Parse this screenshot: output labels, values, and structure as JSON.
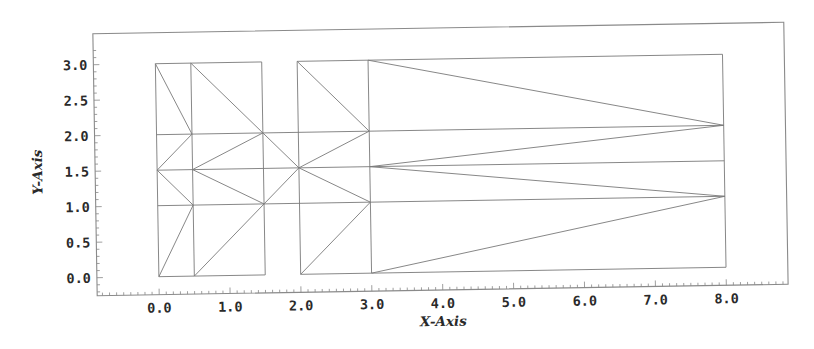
{
  "chart_data": {
    "type": "mesh",
    "title": "",
    "xlabel": "X-Axis",
    "ylabel": "Y-Axis",
    "xlim": [
      -0.9,
      8.9
    ],
    "ylim": [
      -0.45,
      3.3
    ],
    "grid": false,
    "legend": null,
    "x_ticks": [
      "0.0",
      "1.0",
      "2.0",
      "3.0",
      "4.0",
      "5.0",
      "6.0",
      "7.0",
      "8.0"
    ],
    "y_ticks": [
      "0.0",
      "0.5",
      "1.0",
      "1.5",
      "2.0",
      "2.5",
      "3.0"
    ],
    "blocks": [
      {
        "name": "block-1",
        "x": [
          0.0,
          0.5
        ],
        "y": [
          0.0,
          3.0
        ]
      },
      {
        "name": "block-2",
        "x": [
          0.5,
          1.5
        ],
        "y": [
          0.0,
          3.0
        ]
      },
      {
        "name": "block-3",
        "x": [
          2.0,
          3.0
        ],
        "y": [
          0.0,
          3.0
        ]
      },
      {
        "name": "block-4",
        "x": [
          3.0,
          8.0
        ],
        "y": [
          0.0,
          3.0
        ]
      }
    ],
    "segments": [
      [
        [
          0.0,
          0.0
        ],
        [
          0.5,
          0.0
        ]
      ],
      [
        [
          0.5,
          0.0
        ],
        [
          1.5,
          0.0
        ]
      ],
      [
        [
          2.0,
          0.0
        ],
        [
          3.0,
          0.0
        ]
      ],
      [
        [
          3.0,
          0.0
        ],
        [
          8.0,
          0.0
        ]
      ],
      [
        [
          0.0,
          3.0
        ],
        [
          0.5,
          3.0
        ]
      ],
      [
        [
          0.5,
          3.0
        ],
        [
          1.5,
          3.0
        ]
      ],
      [
        [
          2.0,
          3.0
        ],
        [
          3.0,
          3.0
        ]
      ],
      [
        [
          3.0,
          3.0
        ],
        [
          8.0,
          3.0
        ]
      ],
      [
        [
          0.0,
          0.0
        ],
        [
          0.0,
          3.0
        ]
      ],
      [
        [
          0.5,
          0.0
        ],
        [
          0.5,
          3.0
        ]
      ],
      [
        [
          1.5,
          0.0
        ],
        [
          1.5,
          3.0
        ]
      ],
      [
        [
          2.0,
          0.0
        ],
        [
          2.0,
          3.0
        ]
      ],
      [
        [
          3.0,
          0.0
        ],
        [
          3.0,
          3.0
        ]
      ],
      [
        [
          8.0,
          0.0
        ],
        [
          8.0,
          3.0
        ]
      ],
      [
        [
          0.0,
          1.0
        ],
        [
          8.0,
          1.0
        ]
      ],
      [
        [
          0.0,
          1.5
        ],
        [
          8.0,
          1.5
        ]
      ],
      [
        [
          0.0,
          2.0
        ],
        [
          8.0,
          2.0
        ]
      ],
      [
        [
          0.0,
          3.0
        ],
        [
          0.5,
          2.0
        ]
      ],
      [
        [
          0.0,
          1.5
        ],
        [
          0.5,
          2.0
        ]
      ],
      [
        [
          0.0,
          1.5
        ],
        [
          0.5,
          1.0
        ]
      ],
      [
        [
          0.0,
          0.0
        ],
        [
          0.5,
          1.0
        ]
      ],
      [
        [
          0.5,
          3.0
        ],
        [
          1.5,
          2.0
        ]
      ],
      [
        [
          0.5,
          1.5
        ],
        [
          1.5,
          2.0
        ]
      ],
      [
        [
          0.5,
          1.5
        ],
        [
          1.5,
          1.0
        ]
      ],
      [
        [
          0.5,
          0.0
        ],
        [
          1.5,
          1.0
        ]
      ],
      [
        [
          1.5,
          2.0
        ],
        [
          2.0,
          1.5
        ]
      ],
      [
        [
          1.5,
          1.0
        ],
        [
          2.0,
          1.5
        ]
      ],
      [
        [
          2.0,
          3.0
        ],
        [
          3.0,
          2.0
        ]
      ],
      [
        [
          2.0,
          1.5
        ],
        [
          3.0,
          2.0
        ]
      ],
      [
        [
          2.0,
          1.5
        ],
        [
          3.0,
          1.0
        ]
      ],
      [
        [
          2.0,
          0.0
        ],
        [
          3.0,
          1.0
        ]
      ],
      [
        [
          3.0,
          3.0
        ],
        [
          8.0,
          2.0
        ]
      ],
      [
        [
          3.0,
          1.5
        ],
        [
          8.0,
          2.0
        ]
      ],
      [
        [
          3.0,
          1.5
        ],
        [
          8.0,
          1.0
        ]
      ],
      [
        [
          3.0,
          0.0
        ],
        [
          8.0,
          1.0
        ]
      ]
    ]
  },
  "colors": {
    "background": "#ffffff",
    "frame": "#8a8a8a",
    "mesh": "#7a7a7a",
    "text": "#2a2a2a"
  }
}
